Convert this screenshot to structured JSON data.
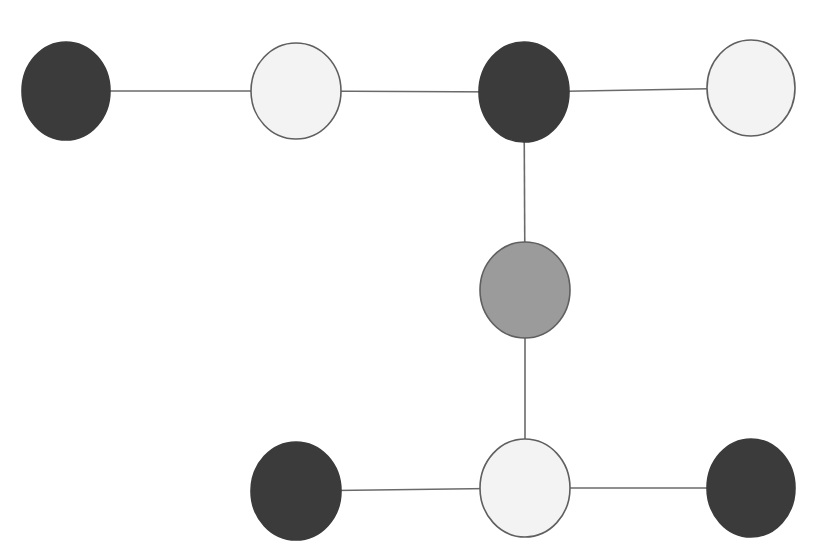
{
  "diagram": {
    "type": "graph",
    "title_fragment": "",
    "colors": {
      "dark": "#3b3b3b",
      "gray": "#9b9b9b",
      "light": "#f3f3f3",
      "stroke": "#5f5f5f",
      "edge": "#6a6a6a"
    },
    "nodes": [
      {
        "id": "n1",
        "cx": 66,
        "cy": 91,
        "rx": 44,
        "ry": 49,
        "fill": "dark"
      },
      {
        "id": "n2",
        "cx": 296,
        "cy": 91,
        "rx": 45,
        "ry": 48,
        "fill": "light"
      },
      {
        "id": "n3",
        "cx": 524,
        "cy": 92,
        "rx": 45,
        "ry": 50,
        "fill": "dark"
      },
      {
        "id": "n4",
        "cx": 751,
        "cy": 88,
        "rx": 44,
        "ry": 48,
        "fill": "light"
      },
      {
        "id": "n5",
        "cx": 525,
        "cy": 290,
        "rx": 45,
        "ry": 48,
        "fill": "gray"
      },
      {
        "id": "n6",
        "cx": 296,
        "cy": 491,
        "rx": 45,
        "ry": 49,
        "fill": "dark"
      },
      {
        "id": "n7",
        "cx": 525,
        "cy": 488,
        "rx": 45,
        "ry": 49,
        "fill": "light"
      },
      {
        "id": "n8",
        "cx": 751,
        "cy": 488,
        "rx": 44,
        "ry": 49,
        "fill": "dark"
      }
    ],
    "edges": [
      {
        "from": "n1",
        "to": "n2"
      },
      {
        "from": "n2",
        "to": "n3"
      },
      {
        "from": "n3",
        "to": "n4"
      },
      {
        "from": "n3",
        "to": "n5"
      },
      {
        "from": "n5",
        "to": "n7"
      },
      {
        "from": "n6",
        "to": "n7"
      },
      {
        "from": "n7",
        "to": "n8"
      }
    ]
  }
}
